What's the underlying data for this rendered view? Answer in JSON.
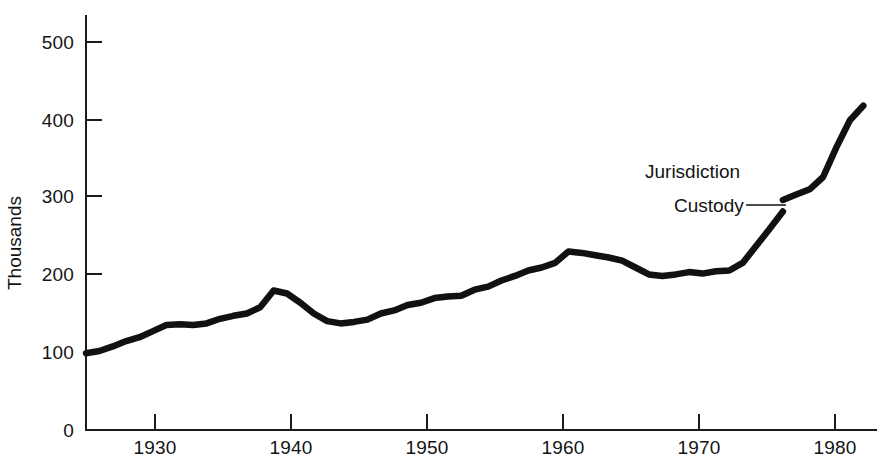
{
  "figure": {
    "background": "#ffffff",
    "ink_color": "#111111"
  },
  "axes": {
    "y_title": "Thousands",
    "y_ticks": [
      "0",
      "100",
      "200",
      "300",
      "400",
      "500"
    ],
    "x_ticks": [
      "1930",
      "1940",
      "1950",
      "1960",
      "1970",
      "1980"
    ]
  },
  "annotations": {
    "jurisdiction": "Jurisdiction",
    "custody": "Custody"
  },
  "chart_data": {
    "type": "line",
    "title": "",
    "subtitle": "",
    "xlabel": "",
    "ylabel": "Thousands",
    "xlim": [
      1925,
      1983.5
    ],
    "ylim": [
      0,
      540
    ],
    "grid": false,
    "legend_position": "inline-annotation",
    "y_tick_values": [
      0,
      100,
      200,
      300,
      400,
      500
    ],
    "x_tick_values": [
      1930,
      1940,
      1950,
      1960,
      1970,
      1980
    ],
    "annotations": [
      {
        "text": "Jurisdiction",
        "x": 1976.5,
        "y": 330,
        "note": "upper series label, no leader"
      },
      {
        "text": "Custody",
        "x": 1974.0,
        "y": 295,
        "note": "lower series label with leader line to curve end at 1977"
      }
    ],
    "series": [
      {
        "name": "Custody",
        "x": [
          1925,
          1926,
          1927,
          1928,
          1929,
          1930,
          1931,
          1932,
          1933,
          1934,
          1935,
          1936,
          1937,
          1938,
          1939,
          1940,
          1941,
          1942,
          1943,
          1944,
          1945,
          1946,
          1947,
          1948,
          1949,
          1950,
          1951,
          1952,
          1953,
          1954,
          1955,
          1956,
          1957,
          1958,
          1959,
          1960,
          1961,
          1962,
          1963,
          1964,
          1965,
          1966,
          1967,
          1968,
          1969,
          1970,
          1971,
          1972,
          1973,
          1974,
          1975,
          1976,
          1977
        ],
        "values": [
          100,
          103,
          109,
          116,
          121,
          129,
          137,
          138,
          137,
          139,
          145,
          149,
          152,
          160,
          182,
          178,
          166,
          152,
          142,
          139,
          141,
          144,
          152,
          156,
          163,
          166,
          172,
          174,
          175,
          183,
          187,
          195,
          201,
          208,
          212,
          218,
          233,
          231,
          228,
          225,
          221,
          212,
          203,
          201,
          203,
          206,
          204,
          207,
          208,
          218,
          240,
          262,
          285
        ]
      },
      {
        "name": "Jurisdiction",
        "x": [
          1977,
          1978,
          1979,
          1980,
          1981,
          1982,
          1983
        ],
        "values": [
          300,
          307,
          314,
          330,
          369,
          404,
          423
        ]
      }
    ]
  }
}
